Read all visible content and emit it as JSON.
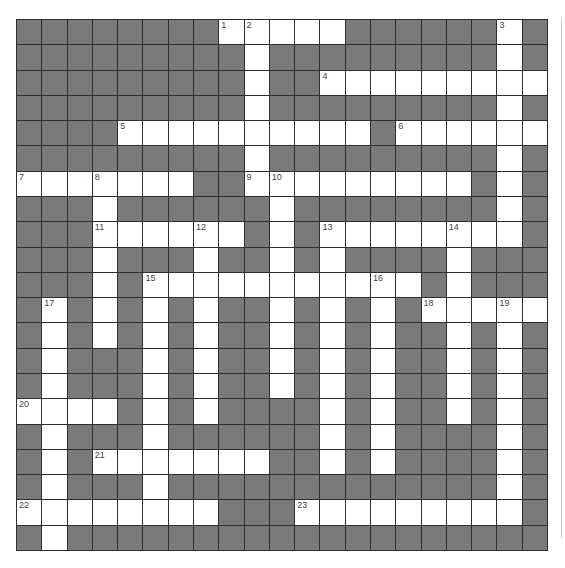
{
  "puzzle": {
    "rows": 21,
    "cols": 21,
    "colors": {
      "block": "#7a7a7a",
      "open": "#ffffff",
      "gridline": "#2e2e2e",
      "number": "#444444"
    },
    "layout": [
      "........#####......#.",
      ".........#.........#.",
      ".........#..########.",
      ".........#.........#.",
      "....##########.######",
      ".........#.........#.",
      "#######..##########.#",
      "...#......#........#.",
      "...######.#.########.",
      "...#...#..#.#....#...",
      "...#.###########.#...",
      ".#.#.#.#..#.#.#.#####",
      ".#.#.#.#..#.#.#..#.#.",
      ".#...#.#..#.#.#..#.#.",
      ".#...#.#..#.#.#..#.#.",
      "####.#.#....#.#..#.#.",
      ".#...#......#.#....#.",
      ".#.#######..#.#....#.",
      ".#...#.............#.",
      "########...#########.",
      ".#..................."
    ],
    "numbers": [
      {
        "n": "1",
        "r": 0,
        "c": 8
      },
      {
        "n": "2",
        "r": 0,
        "c": 9
      },
      {
        "n": "3",
        "r": 0,
        "c": 19
      },
      {
        "n": "4",
        "r": 2,
        "c": 12
      },
      {
        "n": "5",
        "r": 4,
        "c": 4
      },
      {
        "n": "6",
        "r": 4,
        "c": 15
      },
      {
        "n": "7",
        "r": 6,
        "c": 0
      },
      {
        "n": "8",
        "r": 6,
        "c": 3
      },
      {
        "n": "9",
        "r": 6,
        "c": 9
      },
      {
        "n": "10",
        "r": 6,
        "c": 10
      },
      {
        "n": "11",
        "r": 8,
        "c": 3
      },
      {
        "n": "12",
        "r": 8,
        "c": 7
      },
      {
        "n": "13",
        "r": 8,
        "c": 12
      },
      {
        "n": "14",
        "r": 8,
        "c": 17
      },
      {
        "n": "15",
        "r": 10,
        "c": 5
      },
      {
        "n": "16",
        "r": 10,
        "c": 14
      },
      {
        "n": "17",
        "r": 11,
        "c": 1
      },
      {
        "n": "18",
        "r": 11,
        "c": 16
      },
      {
        "n": "19",
        "r": 11,
        "c": 19
      },
      {
        "n": "20",
        "r": 15,
        "c": 0
      },
      {
        "n": "21",
        "r": 17,
        "c": 3
      },
      {
        "n": "22",
        "r": 19,
        "c": 0
      },
      {
        "n": "23",
        "r": 19,
        "c": 11
      }
    ]
  }
}
